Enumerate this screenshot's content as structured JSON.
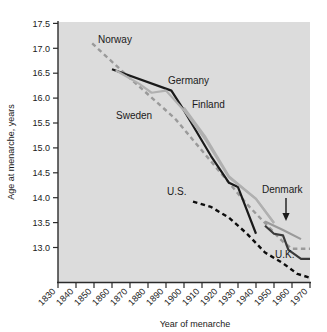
{
  "chart_data": {
    "type": "line",
    "title": "",
    "xlabel": "Year of menarche",
    "ylabel": "Age at menarche, years",
    "xlim": [
      1830,
      1970
    ],
    "ylim": [
      12.65,
      17.5
    ],
    "grid": false,
    "legend": "inline-labels",
    "xticks": [
      "1830",
      "1840",
      "1850",
      "1860",
      "1870",
      "1880",
      "1890",
      "1900",
      "1910",
      "1920",
      "1930",
      "1940",
      "1950",
      "1960",
      "1970"
    ],
    "yticks": [
      "13.0",
      "13.5",
      "14.0",
      "14.5",
      "15.0",
      "15.5",
      "16.0",
      "16.5",
      "17.0",
      "17.5"
    ],
    "plot_bg": "#dcdcdc",
    "series": [
      {
        "name": "Norway",
        "label": "Norway",
        "color": "#9a9a9a",
        "style": "dashed",
        "x": [
          1849,
          1870,
          1885,
          1895,
          1905,
          1920,
          1935,
          1945,
          1955,
          1960,
          1970
        ],
        "y": [
          17.1,
          16.45,
          16.0,
          15.7,
          15.3,
          14.7,
          14.1,
          13.75,
          13.4,
          13.27,
          13.27
        ]
      },
      {
        "name": "Germany",
        "label": "Germany",
        "color": "#1a1a1a",
        "style": "solid",
        "x": [
          1860,
          1893,
          1900,
          1915,
          1925,
          1930,
          1940
        ],
        "y": [
          16.62,
          16.22,
          15.85,
          15.0,
          14.5,
          14.42,
          13.55
        ]
      },
      {
        "name": "Sweden",
        "label": "Sweden",
        "color": "#b0b0b0",
        "style": "solid",
        "x": [
          1862,
          1875,
          1882,
          1890,
          1900,
          1912,
          1925,
          1940,
          1950
        ],
        "y": [
          16.6,
          16.35,
          16.18,
          16.22,
          15.85,
          15.3,
          14.6,
          14.2,
          13.75
        ]
      },
      {
        "name": "Finland",
        "label": "Finland",
        "color": "#b0b0b0",
        "style": "solid",
        "x": [
          1900,
          1912,
          1925,
          1940,
          1950
        ],
        "y": [
          15.9,
          15.35,
          14.62,
          14.2,
          13.75
        ]
      },
      {
        "name": "U.S.",
        "label": "U.S.",
        "color": "#0d0d0d",
        "style": "dashed",
        "x": [
          1905,
          1915,
          1925,
          1935,
          1945,
          1955,
          1963,
          1970
        ],
        "y": [
          14.15,
          14.05,
          13.85,
          13.55,
          13.2,
          13.0,
          12.8,
          12.73
        ]
      },
      {
        "name": "Denmark",
        "label": "Denmark",
        "color": "#9a9a9a",
        "style": "solid",
        "x": [
          1945,
          1955,
          1965
        ],
        "y": [
          13.78,
          13.62,
          13.45
        ]
      },
      {
        "name": "U.K.",
        "label": "U.K.",
        "color": "#3a3a3a",
        "style": "solid",
        "x": [
          1945,
          1950,
          1955,
          1958,
          1965,
          1970
        ],
        "y": [
          13.7,
          13.55,
          13.52,
          13.25,
          13.08,
          13.08
        ]
      }
    ],
    "annotations": [
      {
        "name": "denmark-arrow",
        "type": "arrow",
        "from": [
          1960,
          14.0
        ],
        "to": [
          1960,
          13.62
        ]
      }
    ]
  },
  "labels": {
    "norway": "Norway",
    "germany": "Germany",
    "sweden": "Sweden",
    "finland": "Finland",
    "us": "U.S.",
    "denmark": "Denmark",
    "uk": "U.K.",
    "xaxis_title": "Year of menarche",
    "yaxis_title": "Age at menarche, years"
  },
  "yticks": {
    "t0": "13.0",
    "t1": "13.5",
    "t2": "14.0",
    "t3": "14.5",
    "t4": "15.0",
    "t5": "15.5",
    "t6": "16.0",
    "t7": "16.5",
    "t8": "17.0",
    "t9": "17.5"
  },
  "xticks": {
    "t0": "1830",
    "t1": "1840",
    "t2": "1850",
    "t3": "1860",
    "t4": "1870",
    "t5": "1880",
    "t6": "1890",
    "t7": "1900",
    "t8": "1910",
    "t9": "1920",
    "t10": "1930",
    "t11": "1940",
    "t12": "1950",
    "t13": "1960",
    "t14": "1970"
  }
}
